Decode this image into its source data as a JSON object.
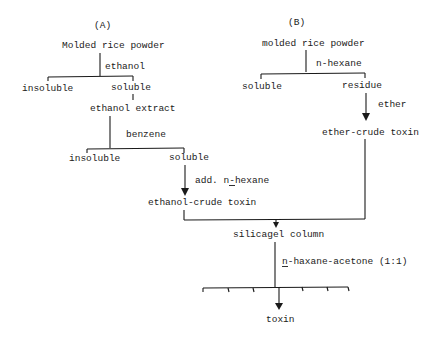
{
  "diagram": {
    "type": "flowchart",
    "panel_a": {
      "label": "(A)",
      "start": "Molded rice powder",
      "step1_solvent": "ethanol",
      "step1_insoluble": "insoluble",
      "step1_soluble": "soluble",
      "extract": "ethanol extract",
      "step2_solvent": "benzene",
      "step2_insoluble": "insoluble",
      "step2_soluble": "soluble",
      "step3_prefix": "add. ",
      "step3_reagent_underlined": "n",
      "step3_reagent_rest": "-hexane",
      "result": "ethanol-crude toxin"
    },
    "panel_b": {
      "label": "(B)",
      "start": "molded rice powder",
      "step1_solvent": "n-hexane",
      "step1_soluble": "soluble",
      "step1_residue": "residue",
      "step2_solvent": "ether",
      "result": "ether-crude toxin"
    },
    "merge": {
      "column": "silicagel column",
      "eluent_underlined": "n",
      "eluent_rest": "-haxane-acetone (1:1)",
      "final": "toxin"
    }
  }
}
